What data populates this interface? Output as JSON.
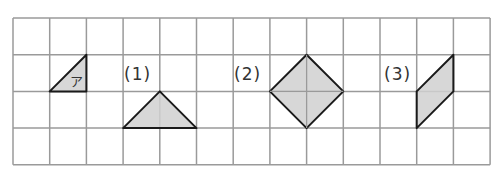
{
  "grid": {
    "cols": 13,
    "rows": 4,
    "left": 13,
    "top": 18,
    "cell": 36.7,
    "line_color": "#9a9a9a"
  },
  "colors": {
    "fill": "#d0d0d0",
    "stroke": "#1a1a1a"
  },
  "shapes": [
    {
      "name": "shape-a",
      "label": "ア",
      "points": [
        [
          1,
          2
        ],
        [
          2,
          1
        ],
        [
          2,
          2
        ]
      ]
    },
    {
      "name": "shape-1",
      "label": "(1)",
      "points": [
        [
          3,
          3
        ],
        [
          4,
          2
        ],
        [
          5,
          3
        ]
      ]
    },
    {
      "name": "shape-2",
      "label": "(2)",
      "points": [
        [
          7,
          2
        ],
        [
          8,
          1
        ],
        [
          9,
          2
        ],
        [
          8,
          3
        ]
      ]
    },
    {
      "name": "shape-3",
      "label": "(3)",
      "points": [
        [
          11,
          2
        ],
        [
          12,
          1
        ],
        [
          12,
          2
        ],
        [
          11,
          3
        ]
      ]
    }
  ],
  "labels": {
    "a": "ア",
    "one": "(1)",
    "two": "(2)",
    "three": "(3)"
  }
}
